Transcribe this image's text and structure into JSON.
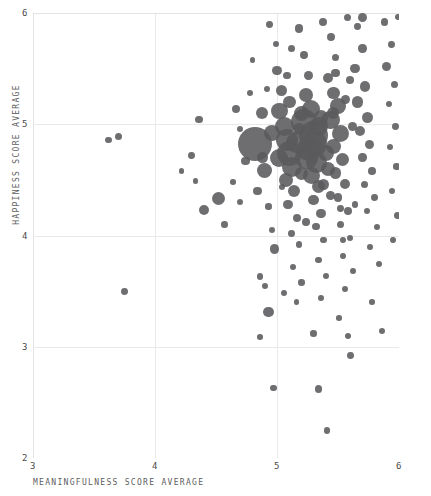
{
  "chart_data": {
    "type": "scatter",
    "title": "",
    "subtitle": "",
    "xlabel": "MEANINGFULNESS SCORE AVERAGE",
    "ylabel": "HAPPINESS SCORE AVERAGE",
    "xlim": [
      3,
      6
    ],
    "ylim": [
      2,
      6
    ],
    "xticks": [
      "3",
      "4",
      "5",
      "6"
    ],
    "yticks": [
      "2",
      "3",
      "4",
      "5",
      "6"
    ],
    "grid": true,
    "legend": null,
    "marker": {
      "shape": "circle",
      "color": "#5a5a5c",
      "opacity": 0.88,
      "size_encoding": "bubble area varies by point weight"
    },
    "points": [
      {
        "x": 3.62,
        "y": 4.86,
        "r": 3.2
      },
      {
        "x": 3.7,
        "y": 4.89,
        "r": 3.6
      },
      {
        "x": 3.75,
        "y": 3.5,
        "r": 3.4
      },
      {
        "x": 4.36,
        "y": 5.04,
        "r": 3.6
      },
      {
        "x": 4.3,
        "y": 4.72,
        "r": 3.4
      },
      {
        "x": 4.52,
        "y": 4.33,
        "r": 6.5
      },
      {
        "x": 4.4,
        "y": 4.23,
        "r": 5.2
      },
      {
        "x": 4.57,
        "y": 4.1,
        "r": 3.3
      },
      {
        "x": 4.22,
        "y": 4.58,
        "r": 2.6
      },
      {
        "x": 4.33,
        "y": 4.49,
        "r": 2.7
      },
      {
        "x": 4.66,
        "y": 5.14,
        "r": 4.0
      },
      {
        "x": 4.7,
        "y": 4.96,
        "r": 3.1
      },
      {
        "x": 4.74,
        "y": 4.67,
        "r": 4.4
      },
      {
        "x": 4.78,
        "y": 5.28,
        "r": 3.0
      },
      {
        "x": 4.82,
        "y": 4.82,
        "r": 17.0
      },
      {
        "x": 4.88,
        "y": 5.1,
        "r": 6.0
      },
      {
        "x": 4.9,
        "y": 4.58,
        "r": 7.5
      },
      {
        "x": 4.84,
        "y": 4.4,
        "r": 4.1
      },
      {
        "x": 4.93,
        "y": 4.26,
        "r": 3.2
      },
      {
        "x": 4.96,
        "y": 4.05,
        "r": 3.0
      },
      {
        "x": 4.98,
        "y": 3.88,
        "r": 4.8
      },
      {
        "x": 4.86,
        "y": 3.63,
        "r": 3.4
      },
      {
        "x": 4.9,
        "y": 3.55,
        "r": 3.0
      },
      {
        "x": 4.93,
        "y": 3.31,
        "r": 5.2
      },
      {
        "x": 4.86,
        "y": 3.09,
        "r": 2.8
      },
      {
        "x": 4.97,
        "y": 2.63,
        "r": 3.3
      },
      {
        "x": 5.0,
        "y": 5.48,
        "r": 4.6
      },
      {
        "x": 5.04,
        "y": 5.3,
        "r": 5.6
      },
      {
        "x": 5.02,
        "y": 5.12,
        "r": 8.2
      },
      {
        "x": 5.06,
        "y": 4.98,
        "r": 9.5
      },
      {
        "x": 5.08,
        "y": 4.86,
        "r": 11.0
      },
      {
        "x": 5.1,
        "y": 4.74,
        "r": 12.5
      },
      {
        "x": 5.12,
        "y": 4.62,
        "r": 10.0
      },
      {
        "x": 5.07,
        "y": 4.5,
        "r": 7.0
      },
      {
        "x": 5.14,
        "y": 4.4,
        "r": 6.2
      },
      {
        "x": 5.09,
        "y": 4.28,
        "r": 4.6
      },
      {
        "x": 5.16,
        "y": 4.16,
        "r": 4.0
      },
      {
        "x": 5.12,
        "y": 4.02,
        "r": 3.4
      },
      {
        "x": 5.18,
        "y": 3.92,
        "r": 3.2
      },
      {
        "x": 5.13,
        "y": 3.72,
        "r": 3.0
      },
      {
        "x": 5.2,
        "y": 3.58,
        "r": 3.3
      },
      {
        "x": 5.16,
        "y": 3.4,
        "r": 2.9
      },
      {
        "x": 5.22,
        "y": 5.62,
        "r": 4.2
      },
      {
        "x": 5.26,
        "y": 5.44,
        "r": 4.4
      },
      {
        "x": 5.24,
        "y": 5.26,
        "r": 7.0
      },
      {
        "x": 5.28,
        "y": 5.14,
        "r": 9.0
      },
      {
        "x": 5.22,
        "y": 5.02,
        "r": 13.0
      },
      {
        "x": 5.3,
        "y": 4.9,
        "r": 14.5
      },
      {
        "x": 5.26,
        "y": 4.78,
        "r": 12.0
      },
      {
        "x": 5.32,
        "y": 4.66,
        "r": 10.5
      },
      {
        "x": 5.28,
        "y": 4.54,
        "r": 8.5
      },
      {
        "x": 5.34,
        "y": 4.44,
        "r": 6.8
      },
      {
        "x": 5.3,
        "y": 4.32,
        "r": 5.4
      },
      {
        "x": 5.36,
        "y": 4.2,
        "r": 4.6
      },
      {
        "x": 5.32,
        "y": 4.08,
        "r": 3.8
      },
      {
        "x": 5.38,
        "y": 3.96,
        "r": 3.4
      },
      {
        "x": 5.34,
        "y": 3.78,
        "r": 3.1
      },
      {
        "x": 5.4,
        "y": 3.64,
        "r": 3.0
      },
      {
        "x": 5.36,
        "y": 3.44,
        "r": 2.9
      },
      {
        "x": 5.3,
        "y": 3.12,
        "r": 3.2
      },
      {
        "x": 5.34,
        "y": 2.62,
        "r": 3.6
      },
      {
        "x": 5.41,
        "y": 2.25,
        "r": 3.4
      },
      {
        "x": 5.44,
        "y": 5.78,
        "r": 4.0
      },
      {
        "x": 5.48,
        "y": 5.6,
        "r": 3.8
      },
      {
        "x": 5.42,
        "y": 5.42,
        "r": 5.0
      },
      {
        "x": 5.46,
        "y": 5.28,
        "r": 6.4
      },
      {
        "x": 5.5,
        "y": 5.16,
        "r": 8.0
      },
      {
        "x": 5.44,
        "y": 5.04,
        "r": 9.2
      },
      {
        "x": 5.52,
        "y": 4.92,
        "r": 8.6
      },
      {
        "x": 5.46,
        "y": 4.8,
        "r": 7.4
      },
      {
        "x": 5.54,
        "y": 4.68,
        "r": 6.6
      },
      {
        "x": 5.48,
        "y": 4.56,
        "r": 5.8
      },
      {
        "x": 5.56,
        "y": 4.46,
        "r": 5.0
      },
      {
        "x": 5.5,
        "y": 4.34,
        "r": 4.4
      },
      {
        "x": 5.58,
        "y": 4.22,
        "r": 4.0
      },
      {
        "x": 5.52,
        "y": 4.1,
        "r": 3.6
      },
      {
        "x": 5.6,
        "y": 3.98,
        "r": 3.2
      },
      {
        "x": 5.54,
        "y": 3.82,
        "r": 3.0
      },
      {
        "x": 5.62,
        "y": 3.68,
        "r": 2.9
      },
      {
        "x": 5.56,
        "y": 3.52,
        "r": 3.1
      },
      {
        "x": 5.51,
        "y": 3.26,
        "r": 2.8
      },
      {
        "x": 5.58,
        "y": 3.1,
        "r": 3.0
      },
      {
        "x": 5.6,
        "y": 2.92,
        "r": 3.4
      },
      {
        "x": 5.66,
        "y": 5.88,
        "r": 3.4
      },
      {
        "x": 5.7,
        "y": 5.68,
        "r": 4.2
      },
      {
        "x": 5.64,
        "y": 5.5,
        "r": 4.8
      },
      {
        "x": 5.72,
        "y": 5.34,
        "r": 5.2
      },
      {
        "x": 5.66,
        "y": 5.2,
        "r": 5.6
      },
      {
        "x": 5.74,
        "y": 5.06,
        "r": 5.4
      },
      {
        "x": 5.68,
        "y": 4.94,
        "r": 5.0
      },
      {
        "x": 5.76,
        "y": 4.82,
        "r": 4.6
      },
      {
        "x": 5.7,
        "y": 4.7,
        "r": 4.2
      },
      {
        "x": 5.78,
        "y": 4.58,
        "r": 3.8
      },
      {
        "x": 5.72,
        "y": 4.46,
        "r": 3.6
      },
      {
        "x": 5.8,
        "y": 4.34,
        "r": 3.4
      },
      {
        "x": 5.74,
        "y": 4.22,
        "r": 3.2
      },
      {
        "x": 5.82,
        "y": 4.08,
        "r": 3.0
      },
      {
        "x": 5.76,
        "y": 3.9,
        "r": 2.9
      },
      {
        "x": 5.84,
        "y": 3.74,
        "r": 3.0
      },
      {
        "x": 5.78,
        "y": 3.4,
        "r": 2.8
      },
      {
        "x": 5.86,
        "y": 3.14,
        "r": 3.2
      },
      {
        "x": 5.88,
        "y": 5.92,
        "r": 3.8
      },
      {
        "x": 5.94,
        "y": 5.72,
        "r": 3.4
      },
      {
        "x": 5.9,
        "y": 5.52,
        "r": 4.6
      },
      {
        "x": 5.96,
        "y": 5.36,
        "r": 3.6
      },
      {
        "x": 5.92,
        "y": 5.18,
        "r": 3.2
      },
      {
        "x": 5.97,
        "y": 4.98,
        "r": 3.4
      },
      {
        "x": 5.93,
        "y": 4.8,
        "r": 3.0
      },
      {
        "x": 5.98,
        "y": 4.62,
        "r": 3.2
      },
      {
        "x": 5.94,
        "y": 4.4,
        "r": 3.0
      },
      {
        "x": 5.99,
        "y": 4.18,
        "r": 3.4
      },
      {
        "x": 5.95,
        "y": 3.96,
        "r": 2.9
      },
      {
        "x": 5.99,
        "y": 5.96,
        "r": 3.0
      },
      {
        "x": 5.18,
        "y": 5.86,
        "r": 4.4
      },
      {
        "x": 5.38,
        "y": 5.92,
        "r": 4.0
      },
      {
        "x": 4.99,
        "y": 5.72,
        "r": 3.2
      },
      {
        "x": 5.12,
        "y": 5.68,
        "r": 3.6
      },
      {
        "x": 5.58,
        "y": 5.96,
        "r": 3.6
      },
      {
        "x": 5.7,
        "y": 5.96,
        "r": 4.8
      },
      {
        "x": 4.94,
        "y": 5.9,
        "r": 3.4
      },
      {
        "x": 4.8,
        "y": 5.58,
        "r": 2.8
      },
      {
        "x": 5.04,
        "y": 4.44,
        "r": 3.0
      },
      {
        "x": 5.18,
        "y": 4.96,
        "r": 6.0
      },
      {
        "x": 5.36,
        "y": 5.06,
        "r": 7.2
      },
      {
        "x": 5.4,
        "y": 4.74,
        "r": 8.0
      },
      {
        "x": 5.2,
        "y": 4.56,
        "r": 6.6
      },
      {
        "x": 5.44,
        "y": 4.36,
        "r": 4.8
      },
      {
        "x": 5.24,
        "y": 4.12,
        "r": 3.8
      },
      {
        "x": 5.48,
        "y": 5.46,
        "r": 4.2
      },
      {
        "x": 5.62,
        "y": 4.98,
        "r": 4.4
      },
      {
        "x": 5.64,
        "y": 4.28,
        "r": 3.4
      },
      {
        "x": 5.08,
        "y": 5.44,
        "r": 3.8
      },
      {
        "x": 4.92,
        "y": 5.32,
        "r": 3.0
      },
      {
        "x": 5.06,
        "y": 3.48,
        "r": 3.0
      },
      {
        "x": 5.54,
        "y": 3.96,
        "r": 3.2
      },
      {
        "x": 5.02,
        "y": 4.7,
        "r": 9.0
      },
      {
        "x": 5.16,
        "y": 4.84,
        "r": 10.5
      },
      {
        "x": 5.34,
        "y": 4.98,
        "r": 9.5
      },
      {
        "x": 5.42,
        "y": 4.6,
        "r": 7.0
      },
      {
        "x": 5.1,
        "y": 5.2,
        "r": 6.4
      },
      {
        "x": 4.96,
        "y": 4.92,
        "r": 8.0
      },
      {
        "x": 5.24,
        "y": 4.7,
        "r": 11.5
      },
      {
        "x": 5.3,
        "y": 4.82,
        "r": 13.0
      },
      {
        "x": 5.2,
        "y": 5.1,
        "r": 7.6
      },
      {
        "x": 5.38,
        "y": 4.46,
        "r": 5.6
      },
      {
        "x": 5.46,
        "y": 5.1,
        "r": 6.0
      },
      {
        "x": 5.56,
        "y": 5.22,
        "r": 4.6
      },
      {
        "x": 5.6,
        "y": 5.4,
        "r": 4.0
      },
      {
        "x": 4.7,
        "y": 4.3,
        "r": 3.0
      },
      {
        "x": 4.64,
        "y": 4.48,
        "r": 2.8
      },
      {
        "x": 4.88,
        "y": 4.7,
        "r": 5.4
      },
      {
        "x": 5.52,
        "y": 4.24,
        "r": 3.4
      }
    ]
  },
  "axes": {
    "x_title": "MEANINGFULNESS SCORE AVERAGE",
    "y_title": "HAPPINESS SCORE AVERAGE",
    "x_tick_labels": [
      "3",
      "4",
      "5",
      "6"
    ],
    "y_tick_labels": [
      "2",
      "3",
      "4",
      "5",
      "6"
    ]
  },
  "colors": {
    "marker": "#5a5a5c",
    "grid": "#e9e9ec",
    "text": "#5d5d5d",
    "background": "#ffffff"
  }
}
